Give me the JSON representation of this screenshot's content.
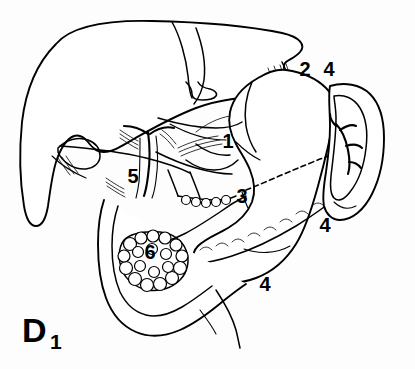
{
  "figure": {
    "panel_label": "D",
    "panel_subscript": "1",
    "background_color": "#fdfdfd",
    "line_color": "#000000"
  },
  "callouts": [
    {
      "id": "c1",
      "text": "1",
      "x": 228,
      "y": 148,
      "target": "lesser-omentum-region"
    },
    {
      "id": "c2",
      "text": "2",
      "x": 305,
      "y": 76,
      "target": "esophagus"
    },
    {
      "id": "c3",
      "text": "3",
      "x": 242,
      "y": 203,
      "target": "pancreas-neck"
    },
    {
      "id": "c4a",
      "text": "4",
      "x": 329,
      "y": 76,
      "target": "spleen-upper"
    },
    {
      "id": "c4b",
      "text": "4",
      "x": 325,
      "y": 232,
      "target": "stomach-greater-curvature"
    },
    {
      "id": "c4c",
      "text": "4",
      "x": 265,
      "y": 291,
      "target": "stomach-lower"
    },
    {
      "id": "c5",
      "text": "5",
      "x": 133,
      "y": 183,
      "target": "porta-hepatis"
    },
    {
      "id": "c6",
      "text": "6",
      "x": 150,
      "y": 259,
      "target": "duodenal-head-lobulated"
    }
  ],
  "structures": [
    {
      "name": "liver",
      "label": ""
    },
    {
      "name": "gallbladder",
      "label": ""
    },
    {
      "name": "stomach",
      "label": ""
    },
    {
      "name": "esophagus",
      "label": ""
    },
    {
      "name": "pancreas",
      "label": ""
    },
    {
      "name": "spleen",
      "label": ""
    },
    {
      "name": "duodenum",
      "label": ""
    },
    {
      "name": "portal-vessels",
      "label": ""
    }
  ]
}
